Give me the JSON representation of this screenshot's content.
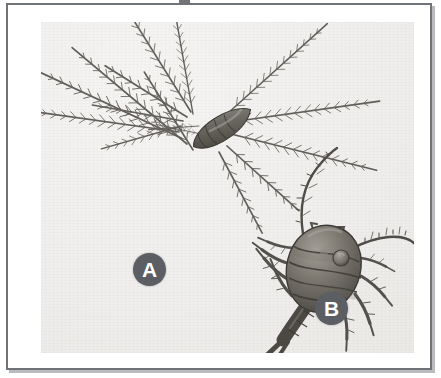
{
  "figure": {
    "kind": "scanned-photographic-plate",
    "canvas": {
      "width": 441,
      "height": 378,
      "background_color": "#ffffff"
    },
    "frame": {
      "border_color": "#6f7277",
      "border_width_px": 2,
      "fill_color": "#ffffff",
      "drop_shadow_color": "#b9bbbe",
      "bounds": {
        "x": 6,
        "y": 3,
        "width": 426,
        "height": 367
      }
    },
    "photo_area": {
      "description": "light warm-gray photographic print surface with visible paper grain",
      "background_color": "#efeeec",
      "bounds": {
        "x": 33,
        "y": 17,
        "width": 373,
        "height": 331
      }
    },
    "top_edge_artifact": {
      "name": "cropped-glyph-remnant",
      "description": "bottom sliver of a dark character cropped off above the plate",
      "color": "#5a5c60",
      "bounds": {
        "x": 179,
        "y": 0,
        "width": 11,
        "height": 3
      }
    }
  },
  "labels": [
    {
      "id": "a",
      "text": "A",
      "shape": "filled-circle",
      "fill_color": "#5b5e62",
      "text_color": "#ffffff",
      "diameter_px": 33,
      "center": {
        "x": 141,
        "y": 264
      },
      "refers_to": "specimen-a"
    },
    {
      "id": "b",
      "text": "B",
      "shape": "filled-circle",
      "fill_color": "#5b5e62",
      "text_color": "#ffffff",
      "diameter_px": 33,
      "center": {
        "x": 323,
        "y": 303
      },
      "refers_to": "specimen-b"
    }
  ],
  "specimens": [
    {
      "id": "specimen-a",
      "label": "A",
      "common_description": "copepod nauplius larva",
      "position_in_photo": "upper-left to upper-centre",
      "body": {
        "shape": "elongate bullet / torpedo, transversely segmented",
        "orientation": "tilted, long axis running upper-right to lower-left",
        "tone_dark": "#4a4742",
        "tone_mid": "#6d6a64",
        "tone_light": "#8d8a84",
        "center": {
          "x": 180,
          "y": 107
        },
        "length_px": 62,
        "width_px": 20,
        "segment_count": 5
      },
      "appendages": {
        "type": "long plumose (feathery) setae",
        "count": 13,
        "description": "very long thin rays radiating in a fan from the body, each fringed with fine barbs along both sides",
        "color": "#55524d",
        "longest_px": 175
      }
    },
    {
      "id": "specimen-b",
      "label": "B",
      "common_description": "adult copepod, dorsal view",
      "position_in_photo": "lower-right",
      "body": {
        "shape": "oval prosome with strongly marked transverse segments, tapering to a narrow urosome",
        "orientation": "head to upper-right, tail to lower-left",
        "tone_dark": "#4b4843",
        "tone_mid": "#716d66",
        "tone_light": "#9a968f",
        "center": {
          "x": 288,
          "y": 253
        },
        "length_px": 108,
        "width_px": 70,
        "segment_count": 6,
        "eye_spot": {
          "x": 300,
          "y": 236,
          "diameter_px": 15
        }
      },
      "appendages": {
        "antennae": {
          "count": 2,
          "description": "two long slender segmented antennae: one sweeping up and left, one arcing out to the right then curving down",
          "color": "#4f4c47",
          "length_px": 120
        },
        "swimming_legs": {
          "count": 8,
          "description": "short spiny legs projecting from the segment margins on both sides",
          "color": "#52504b"
        },
        "furca": {
          "description": "forked caudal rami with terminal setae at the tail tip",
          "color": "#4b4843"
        }
      }
    }
  ]
}
